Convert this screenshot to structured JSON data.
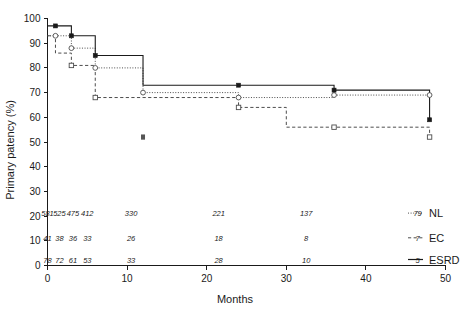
{
  "chart_data": {
    "type": "line",
    "title": "",
    "xlabel": "Months",
    "ylabel": "Primary patency (%)",
    "xlim": [
      0,
      50
    ],
    "ylim": [
      0,
      100
    ],
    "xticks": [
      0,
      10,
      20,
      30,
      40,
      50
    ],
    "yticks": [
      0,
      10,
      20,
      30,
      40,
      50,
      60,
      70,
      80,
      90,
      100
    ],
    "grid": false,
    "legend_position": "right-bottom",
    "step_style": "post",
    "series": [
      {
        "name": "NL",
        "line_style": "dotted",
        "marker": "open-circle",
        "points": [
          {
            "x": 0,
            "y": 93
          },
          {
            "x": 1,
            "y": 93
          },
          {
            "x": 3,
            "y": 88
          },
          {
            "x": 6,
            "y": 80
          },
          {
            "x": 12,
            "y": 70
          },
          {
            "x": 24,
            "y": 68
          },
          {
            "x": 36,
            "y": 69
          },
          {
            "x": 48,
            "y": 69
          }
        ],
        "censor_marks": [
          {
            "x": 1,
            "y": 93
          },
          {
            "x": 3,
            "y": 88
          },
          {
            "x": 6,
            "y": 80
          },
          {
            "x": 12,
            "y": 70
          },
          {
            "x": 24,
            "y": 68
          },
          {
            "x": 36,
            "y": 69
          },
          {
            "x": 48,
            "y": 69
          }
        ]
      },
      {
        "name": "EC",
        "line_style": "dashed",
        "marker": "open-square",
        "points": [
          {
            "x": 0,
            "y": 93
          },
          {
            "x": 1,
            "y": 86
          },
          {
            "x": 3,
            "y": 81
          },
          {
            "x": 6,
            "y": 68
          },
          {
            "x": 12,
            "y": 68
          },
          {
            "x": 24,
            "y": 64
          },
          {
            "x": 30,
            "y": 56
          },
          {
            "x": 36,
            "y": 56
          },
          {
            "x": 48,
            "y": 52
          }
        ],
        "censor_marks": [
          {
            "x": 3,
            "y": 81
          },
          {
            "x": 6,
            "y": 68
          },
          {
            "x": 24,
            "y": 64
          },
          {
            "x": 36,
            "y": 56
          },
          {
            "x": 48,
            "y": 52
          }
        ]
      },
      {
        "name": "ESRD",
        "line_style": "solid",
        "marker": "filled-square",
        "points": [
          {
            "x": 0,
            "y": 97
          },
          {
            "x": 1,
            "y": 97
          },
          {
            "x": 3,
            "y": 93
          },
          {
            "x": 6,
            "y": 85
          },
          {
            "x": 12,
            "y": 73
          },
          {
            "x": 24,
            "y": 73
          },
          {
            "x": 36,
            "y": 71
          },
          {
            "x": 48,
            "y": 59
          }
        ],
        "censor_marks": [
          {
            "x": 1,
            "y": 97
          },
          {
            "x": 3,
            "y": 93
          },
          {
            "x": 6,
            "y": 85
          },
          {
            "x": 24,
            "y": 73
          },
          {
            "x": 36,
            "y": 71
          },
          {
            "x": 48,
            "y": 59
          }
        ]
      }
    ],
    "outlier_markers": [
      {
        "x": 12,
        "y": 52,
        "marker": "filled-square"
      }
    ],
    "risk_table": {
      "rows": [
        {
          "label": "NL",
          "line_style": "dotted",
          "values": [
            {
              "x": 0,
              "n": "581"
            },
            {
              "x": 1.5,
              "n": "525"
            },
            {
              "x": 3.2,
              "n": "475"
            },
            {
              "x": 5,
              "n": "412"
            },
            {
              "x": 10.5,
              "n": "330"
            },
            {
              "x": 21.5,
              "n": "221"
            },
            {
              "x": 32.5,
              "n": "137"
            },
            {
              "x": 46.5,
              "n": "79"
            }
          ]
        },
        {
          "label": "EC",
          "line_style": "dashed",
          "values": [
            {
              "x": 0,
              "n": "41"
            },
            {
              "x": 1.5,
              "n": "38"
            },
            {
              "x": 3.2,
              "n": "36"
            },
            {
              "x": 5,
              "n": "33"
            },
            {
              "x": 10.5,
              "n": "26"
            },
            {
              "x": 21.5,
              "n": "18"
            },
            {
              "x": 32.5,
              "n": "8"
            },
            {
              "x": 46.5,
              "n": "7"
            }
          ]
        },
        {
          "label": "ESRD",
          "line_style": "solid",
          "values": [
            {
              "x": 0,
              "n": "78"
            },
            {
              "x": 1.5,
              "n": "72"
            },
            {
              "x": 3.2,
              "n": "61"
            },
            {
              "x": 5,
              "n": "53"
            },
            {
              "x": 10.5,
              "n": "33"
            },
            {
              "x": 21.5,
              "n": "28"
            },
            {
              "x": 32.5,
              "n": "10"
            },
            {
              "x": 46.5,
              "n": "5"
            }
          ]
        }
      ]
    },
    "colors": {
      "axis": "#1a1a1a",
      "nl": "#4d4d4d",
      "ec": "#4d4d4d",
      "esrd": "#1a1a1a"
    }
  },
  "axes": {
    "y_title": "Primary patency (%)",
    "x_title": "Months",
    "x_tick_labels": [
      "0",
      "10",
      "20",
      "30",
      "40",
      "50"
    ],
    "y_tick_labels": [
      "0",
      "10",
      "20",
      "30",
      "40",
      "50",
      "60",
      "70",
      "80",
      "90",
      "100"
    ]
  },
  "legend": {
    "items": [
      {
        "label": "NL",
        "style": "dotted"
      },
      {
        "label": "EC",
        "style": "dashed"
      },
      {
        "label": "ESRD",
        "style": "solid"
      }
    ]
  }
}
